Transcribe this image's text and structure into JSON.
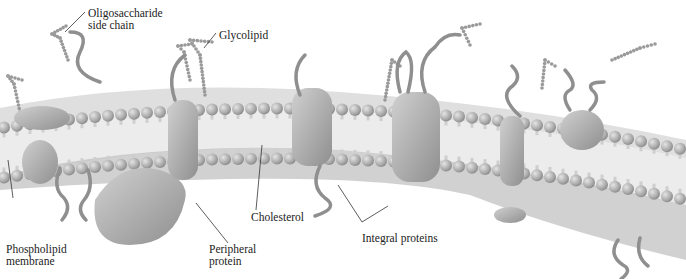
{
  "figure": {
    "labels": {
      "oligosaccharide": "Oligosaccharide\nside chain",
      "glycolipid": "Glycolipid",
      "phospholipid": "Phospholipid\nmembrane",
      "peripheral": "Peripheral\nprotein",
      "cholesterol": "Cholesterol",
      "integral": "Integral proteins"
    },
    "colors": {
      "head": "#b9b9b9",
      "head_dark": "#8e8e8e",
      "tail": "#e6e6e6",
      "protein": "#a8a8a8",
      "chain": "#9a9a9a",
      "leader": "#333333",
      "text": "#222222"
    }
  }
}
